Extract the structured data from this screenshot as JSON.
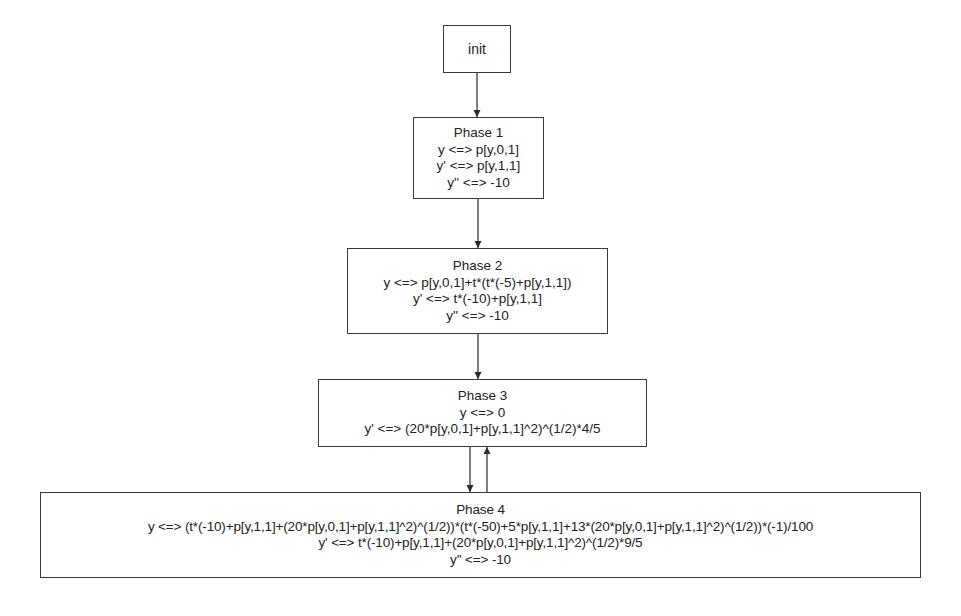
{
  "diagram": {
    "type": "state-flow",
    "nodes": [
      {
        "id": "init",
        "title": "init",
        "lines": []
      },
      {
        "id": "phase1",
        "title": "Phase 1",
        "lines": [
          "y <=> p[y,0,1]",
          "y' <=> p[y,1,1]",
          "y'' <=> -10"
        ]
      },
      {
        "id": "phase2",
        "title": "Phase 2",
        "lines": [
          "y <=> p[y,0,1]+t*(t*(-5)+p[y,1,1])",
          "y' <=> t*(-10)+p[y,1,1]",
          "y'' <=> -10"
        ]
      },
      {
        "id": "phase3",
        "title": "Phase 3",
        "lines": [
          "y <=> 0",
          "y' <=> (20*p[y,0,1]+p[y,1,1]^2)^(1/2)*4/5"
        ]
      },
      {
        "id": "phase4",
        "title": "Phase 4",
        "lines": [
          "y <=> (t*(-10)+p[y,1,1]+(20*p[y,0,1]+p[y,1,1]^2)^(1/2))*(t*(-50)+5*p[y,1,1]+13*(20*p[y,0,1]+p[y,1,1]^2)^(1/2))*(-1)/100",
          "y' <=> t*(-10)+p[y,1,1]+(20*p[y,0,1]+p[y,1,1]^2)^(1/2)*9/5",
          "y'' <=> -10"
        ]
      }
    ],
    "edges": [
      {
        "from": "init",
        "to": "phase1"
      },
      {
        "from": "phase1",
        "to": "phase2"
      },
      {
        "from": "phase2",
        "to": "phase3"
      },
      {
        "from": "phase3",
        "to": "phase4"
      },
      {
        "from": "phase4",
        "to": "phase3"
      }
    ],
    "colors": {
      "line": "#3a3a3a",
      "text": "#222222",
      "background": "#ffffff"
    }
  }
}
